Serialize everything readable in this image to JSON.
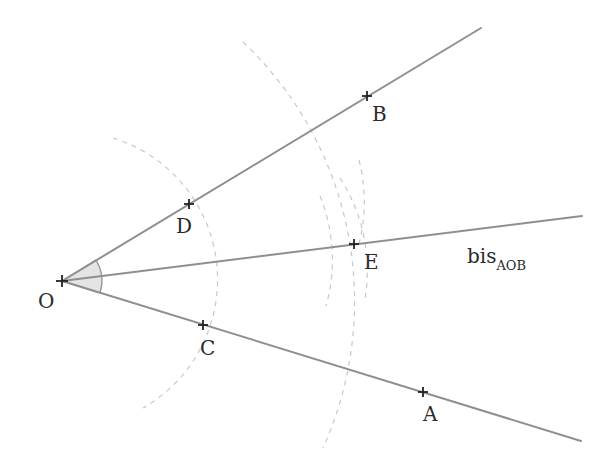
{
  "diagram": {
    "colors": {
      "ray": "#8f8f8f",
      "arc": "#c8c8c8",
      "point": "#222222",
      "angle_fill": "#e4e4e4"
    },
    "points": {
      "O": {
        "label": "O",
        "x": 62,
        "y": 281
      },
      "A": {
        "label": "A",
        "x": 423,
        "y": 392
      },
      "B": {
        "label": "B",
        "x": 367,
        "y": 96
      },
      "C": {
        "label": "C",
        "x": 203,
        "y": 325
      },
      "D": {
        "label": "D",
        "x": 189,
        "y": 204
      },
      "E": {
        "label": "E",
        "x": 354,
        "y": 244
      }
    },
    "rays": [
      {
        "name": "ray-OB",
        "from": "O",
        "to": [
          481,
          28
        ]
      },
      {
        "name": "ray-OA",
        "from": "O",
        "to": [
          581,
          441
        ]
      },
      {
        "name": "bisector-OE",
        "from": "O",
        "to": [
          582,
          216
        ]
      }
    ],
    "bisector_label": {
      "main": "bis",
      "subscript": "AOB"
    }
  }
}
